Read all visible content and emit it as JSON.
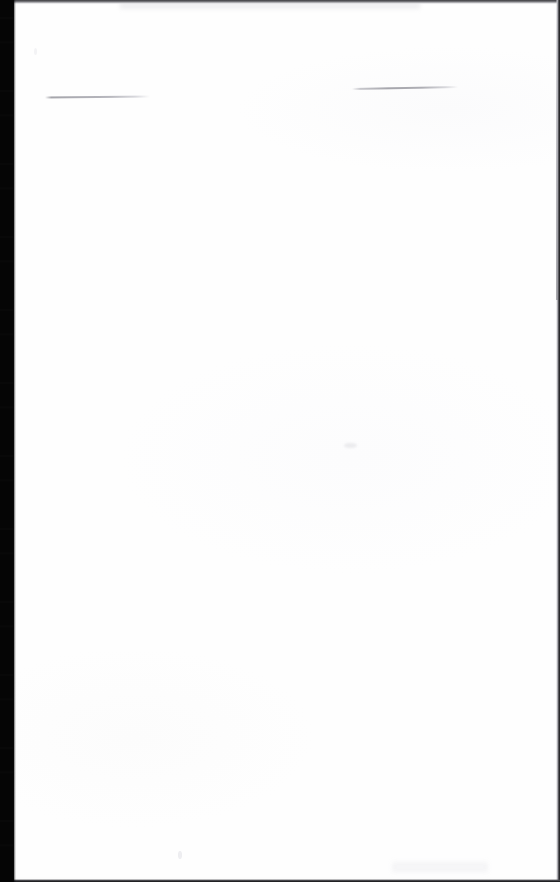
{
  "document": {
    "kind": "scanned-page",
    "title": "Scanned blank page",
    "page_width": 560,
    "page_height": 882,
    "text_content": "",
    "has_text": "false",
    "paper_color": "#fefefe",
    "background_color": "#fdfdfd"
  },
  "scan_artifacts": {
    "gutter": {
      "name": "scanner-gutter-band",
      "edge": "left",
      "color": "#050505",
      "width_px": 14,
      "description": "solid black scanner gutter with faint horizontal streak noise"
    },
    "edges": [
      {
        "name": "top-edge-line",
        "position": "top",
        "color": "#3a3a3d",
        "thickness_px": 4
      },
      {
        "name": "right-edge-line",
        "position": "right",
        "color": "#101012",
        "thickness_px": 4
      },
      {
        "name": "bottom-edge-line",
        "position": "bottom",
        "color": "#0e0e10",
        "thickness_px": 3
      }
    ],
    "marks": [
      {
        "name": "rule-mark-left",
        "type": "horizontal-rule",
        "color": "#a8a8ae",
        "x": 45,
        "y": 97,
        "length_px": 105,
        "thickness_px": 2,
        "tilt_deg": -0.55
      },
      {
        "name": "rule-mark-right",
        "type": "horizontal-rule",
        "color": "#9e9ea5",
        "x": 352,
        "y": 89,
        "length_px": 106,
        "thickness_px": 2,
        "tilt_deg": -1.05
      }
    ],
    "specks": [
      {
        "name": "speck-mid-right",
        "x": 344,
        "y": 443,
        "color": "#d6d6dc"
      },
      {
        "name": "speck-bottom-left",
        "x": 178,
        "y": 851,
        "color": "#dededc"
      },
      {
        "name": "speck-upper-left",
        "x": 34,
        "y": 48,
        "color": "#e4e4e9"
      },
      {
        "name": "smudge-lower-right",
        "x": 392,
        "y": 862,
        "color": "#ececf0"
      }
    ]
  }
}
